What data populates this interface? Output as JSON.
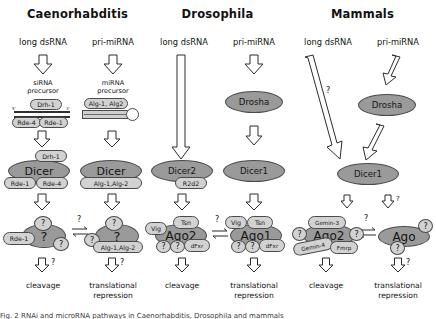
{
  "figure": {
    "columns": [
      {
        "id": "caenorhabditis",
        "title": "Caenorhabditis",
        "pathways": [
          {
            "id": "sirna",
            "source_label": "long dsRNA",
            "precursor_label_line1": "siRNA",
            "precursor_label_line2": "precursor",
            "precursor_type": "linear-duplex",
            "precursor_factors_top": [
              "Drh-1"
            ],
            "precursor_factors_bottom": [
              "Rde-4",
              "Rde-1"
            ],
            "dicer_label": "Dicer",
            "dicer_partners_top": [
              "Drh-1"
            ],
            "dicer_partners_bottom": [
              "Rde-1",
              "Rde-4"
            ],
            "risc_core_label": "?",
            "risc_partners": [
              "Rde-1",
              "?",
              "?"
            ],
            "outcome": "cleavage",
            "outcome_arrow_q": "?"
          },
          {
            "id": "mirna",
            "source_label": "pri-miRNA",
            "precursor_label_line1": "miRNA",
            "precursor_label_line2": "precursor",
            "precursor_type": "hairpin",
            "precursor_factors_top": [
              "Alg-1, Alg2"
            ],
            "precursor_factors_bottom": [],
            "dicer_label": "Dicer",
            "dicer_partners_top": [],
            "dicer_partners_bottom": [
              "Alg-1,Alg-2"
            ],
            "risc_core_label": "?",
            "risc_partners": [
              "?",
              "?",
              "Alg-1,Alg-2"
            ],
            "outcome": "translational repression",
            "outcome_arrow_q": "?"
          }
        ],
        "equilibrium_label": "?"
      },
      {
        "id": "drosophila",
        "title": "Drosophila",
        "pathways": [
          {
            "id": "sirna",
            "source_label": "long dsRNA",
            "long_arrow": true,
            "dicer_label": "Dicer2",
            "dicer_partners_bottom": [
              "R2d2"
            ],
            "risc_core_label": "Ago2",
            "risc_partners": [
              "Vig",
              "Tsn",
              "?",
              "?",
              "dFxr"
            ],
            "outcome": "cleavage"
          },
          {
            "id": "mirna",
            "source_label": "pri-miRNA",
            "drosha_label": "Drosha",
            "dicer_label": "Dicer1",
            "dicer_partners_bottom": [],
            "risc_core_label": "Ago1",
            "risc_partners": [
              "Vig",
              "Tsn",
              "?",
              "?",
              "dFxr"
            ],
            "outcome": "translational repression"
          }
        ],
        "equilibrium_label": "?"
      },
      {
        "id": "mammals",
        "title": "Mammals",
        "pathways": [
          {
            "id": "sirna",
            "source_label": "long dsRNA",
            "diagonal_arrow_label": "?",
            "dicer_label": "Dicer1",
            "risc_core_label": "Ago2",
            "risc_partners": [
              "Gemin-3",
              "Gemin-4",
              "Fmrp",
              "?",
              "?"
            ],
            "outcome": "cleavage"
          },
          {
            "id": "mirna",
            "source_label": "pri-miRNA",
            "drosha_label": "Drosha",
            "dicer_label": "Dicer1",
            "risc_core_label": "Ago",
            "risc_partners": [
              "?",
              "?"
            ],
            "outcome": "translational repression",
            "outcome_arrow_q": "?",
            "dicer_arrow_q": "?"
          }
        ],
        "equilibrium_label": "?"
      }
    ],
    "outcomes": {
      "cleavage": "cleavage",
      "translational_line1": "translational",
      "translational_line2": "repression"
    },
    "caption_partial": "Fig. 2  RNAi and microRNA pathways in Caenorhabditis, Drosophila and mammals"
  }
}
